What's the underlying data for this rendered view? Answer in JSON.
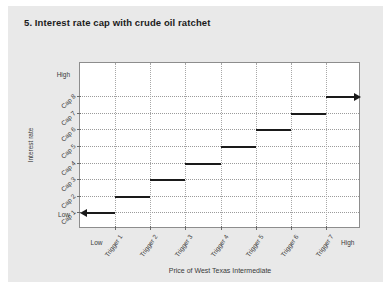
{
  "figure": {
    "title": "5. Interest rate cap with crude oil ratchet",
    "background": "#e9e9e9",
    "plot_background": "#ffffff",
    "line_color": "#1a1a1a",
    "grid_color": "#9b9b9b"
  },
  "chart_data": {
    "type": "line",
    "title": "5. Interest rate cap with crude oil ratchet",
    "xlabel": "Price of West Texas Intermediate",
    "ylabel": "Interest rate",
    "grid": true,
    "legend": null,
    "x_axis": {
      "low_label": "Low",
      "high_label": "High",
      "tick_labels": [
        "Trigger 1",
        "Trigger 2",
        "Trigger 3",
        "Trigger 4",
        "Trigger 5",
        "Trigger 6",
        "Trigger 7"
      ],
      "tick_positions": [
        1,
        2,
        3,
        4,
        5,
        6,
        7
      ],
      "xlim": [
        0,
        8
      ]
    },
    "y_axis": {
      "low_label": "Low",
      "high_label": "High",
      "tick_labels": [
        "Cap 1",
        "Cap 2",
        "Cap 3",
        "Cap 4",
        "Cap 5",
        "Cap 6",
        "Cap 7",
        "Cap 8"
      ],
      "tick_positions": [
        1,
        2,
        3,
        4,
        5,
        6,
        7,
        8
      ],
      "ylim": [
        0,
        10
      ]
    },
    "series": [
      {
        "name": "Interest rate cap",
        "style": "step",
        "left_arrow": true,
        "right_arrow": true,
        "steps": [
          {
            "cap": "Cap 1",
            "y": 1,
            "x_start": 0.0,
            "x_end": 1
          },
          {
            "cap": "Cap 2",
            "y": 2,
            "x_start": 1,
            "x_end": 2
          },
          {
            "cap": "Cap 3",
            "y": 3,
            "x_start": 2,
            "x_end": 3
          },
          {
            "cap": "Cap 4",
            "y": 4,
            "x_start": 3,
            "x_end": 4
          },
          {
            "cap": "Cap 5",
            "y": 5,
            "x_start": 4,
            "x_end": 5
          },
          {
            "cap": "Cap 6",
            "y": 6,
            "x_start": 5,
            "x_end": 6
          },
          {
            "cap": "Cap 7",
            "y": 7,
            "x_start": 6,
            "x_end": 7
          },
          {
            "cap": "Cap 8",
            "y": 8,
            "x_start": 7,
            "x_end": 8.0
          }
        ]
      }
    ]
  }
}
